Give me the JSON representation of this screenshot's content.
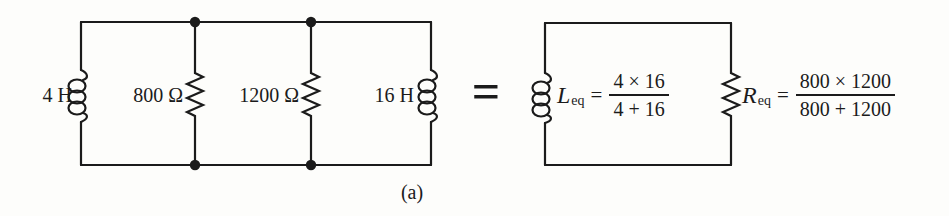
{
  "figure": {
    "caption": "(a)",
    "equals": "="
  },
  "left_circuit": {
    "labels": {
      "inductor_left": "4 H",
      "resistor_1": "800 Ω",
      "resistor_2": "1200 Ω",
      "inductor_right": "16 H"
    }
  },
  "right_circuit": {
    "leq": {
      "variable": "L",
      "subscript": "eq",
      "equals": "=",
      "numerator": "4 × 16",
      "denominator": "4 + 16"
    },
    "req": {
      "variable": "R",
      "subscript": "eq",
      "equals": "=",
      "numerator": "800 × 1200",
      "denominator": "800 + 1200"
    }
  },
  "colors": {
    "ink": "#1b1b1b",
    "paper": "#fdfdfb"
  }
}
